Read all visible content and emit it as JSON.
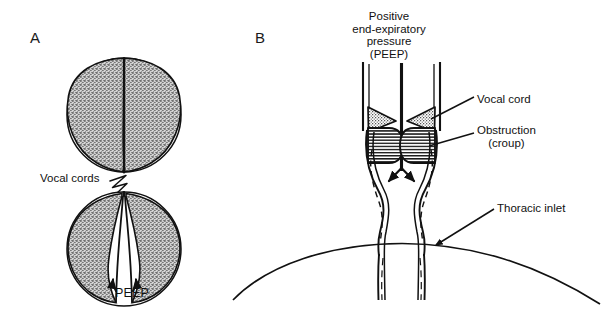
{
  "figure": {
    "width": 613,
    "height": 320,
    "background": "#ffffff",
    "ink_color": "#111111",
    "stipple_color": "#969696",
    "hatch_color": "#1a1a1a"
  },
  "panels": {
    "a": {
      "letter": "A",
      "vocal_cords_label": "Vocal cords",
      "peep_label": "PEEP",
      "top_view_caption": "",
      "bottom_view_caption": ""
    },
    "b": {
      "letter": "B",
      "title_lines": [
        "Positive",
        "end-expiratory",
        "pressure",
        "(PEEP)"
      ],
      "labels": {
        "vocal_cord": "Vocal cord",
        "obstruction": "Obstruction",
        "obstruction_sub": "(croup)",
        "thoracic_inlet": "Thoracic inlet"
      }
    }
  }
}
